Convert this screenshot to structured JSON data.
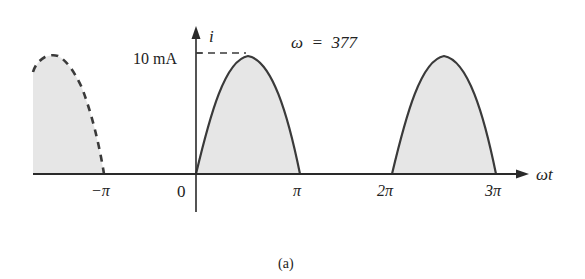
{
  "diagram": {
    "caption": "(a)",
    "y_axis": {
      "label": "i"
    },
    "x_axis": {
      "label": "ωt"
    },
    "peak_label": "10 mA",
    "omega_label": "ω  =  377",
    "ticks": [
      {
        "label": "−π",
        "value": -1
      },
      {
        "label": "0",
        "value": 0
      },
      {
        "label": "π",
        "value": 1
      },
      {
        "label": "2π",
        "value": 2
      },
      {
        "label": "3π",
        "value": 3
      }
    ],
    "pulses": [
      {
        "name": "previous-pulse",
        "from": -2,
        "to": -1,
        "style": "dashed"
      },
      {
        "name": "first-pulse",
        "from": 0,
        "to": 1,
        "style": "solid"
      },
      {
        "name": "second-pulse",
        "from": 2,
        "to": 3,
        "style": "solid"
      }
    ],
    "colors": {
      "line": "#3a3a3a",
      "fill": "#e6e6e6",
      "text": "#222222"
    }
  }
}
